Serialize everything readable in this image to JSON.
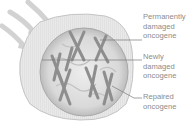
{
  "diagram": {
    "labels": [
      {
        "lines": [
          "Permanently",
          "damaged",
          "oncogene"
        ]
      },
      {
        "lines": [
          "Newly",
          "damaged",
          "oncogene"
        ]
      },
      {
        "lines": [
          "Repaired",
          "oncogene"
        ]
      }
    ],
    "colors": {
      "cell_fill": "#e6e6e6",
      "cell_stroke": "#bdbdbd",
      "nucleus_fill": "#d4d4d4",
      "chromosome": "#8a8a8a",
      "arrow": "#cfcfcf",
      "label_text": "#8c8c8c",
      "leader_line": "#7a7a7a"
    }
  }
}
